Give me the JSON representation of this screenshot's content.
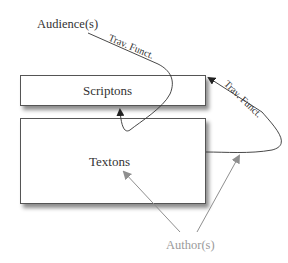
{
  "diagram": {
    "nodes": {
      "audience": {
        "label": "Audience(s)",
        "color": "#333333"
      },
      "scriptons": {
        "label": "Scriptons"
      },
      "textons": {
        "label": "Textons"
      },
      "authors": {
        "label": "Author(s)",
        "color": "#9a9a9a"
      }
    },
    "edges": {
      "audience_to_scriptons": {
        "label": "Trav. Funct.",
        "from": "Audience(s)",
        "to": "Scriptons"
      },
      "textons_to_scriptons": {
        "label": "Trav. Funct.",
        "from": "Textons",
        "to": "Scriptons"
      },
      "authors_to_textons_1": {
        "from": "Author(s)",
        "to": "Textons"
      },
      "authors_to_textons_2": {
        "from": "Author(s)",
        "to": "Textons"
      }
    },
    "colors": {
      "line_dark": "#333333",
      "line_gray": "#8f8f8f",
      "box_border": "#555555"
    }
  }
}
